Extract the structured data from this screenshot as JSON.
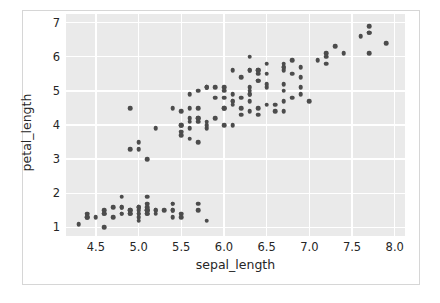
{
  "chart_data": {
    "type": "scatter",
    "title": "",
    "xlabel": "sepal_length",
    "ylabel": "petal_length",
    "xlim": [
      4.15,
      8.12
    ],
    "ylim": [
      0.75,
      7.25
    ],
    "xticks": [
      "4.5",
      "5.0",
      "5.5",
      "6.0",
      "6.5",
      "7.0",
      "7.5",
      "8.0"
    ],
    "xtick_values": [
      4.5,
      5.0,
      5.5,
      6.0,
      6.5,
      7.0,
      7.5,
      8.0
    ],
    "yticks": [
      "1",
      "2",
      "3",
      "4",
      "5",
      "6",
      "7"
    ],
    "ytick_values": [
      1,
      2,
      3,
      4,
      5,
      6,
      7
    ],
    "grid": true,
    "legend": "none",
    "style": "darkgrid",
    "marker_color": "#4c4c4c",
    "axes_bg_color": "#eaeaea",
    "grid_color": "#ffffff",
    "figure_bg_color": "#ffffff",
    "series": [
      {
        "name": "iris",
        "x": [
          5.1,
          4.9,
          4.7,
          4.6,
          5.0,
          5.4,
          4.6,
          5.0,
          4.4,
          4.9,
          5.4,
          4.8,
          4.8,
          4.3,
          5.8,
          5.7,
          5.4,
          5.1,
          5.7,
          5.1,
          5.4,
          5.1,
          4.6,
          5.1,
          4.8,
          5.0,
          5.0,
          5.2,
          5.2,
          4.7,
          4.8,
          5.4,
          5.2,
          5.5,
          4.9,
          5.0,
          5.5,
          4.9,
          4.4,
          5.1,
          5.0,
          4.5,
          4.4,
          5.0,
          5.1,
          4.8,
          5.1,
          4.6,
          5.3,
          5.0,
          7.0,
          6.4,
          6.9,
          5.5,
          6.5,
          5.7,
          6.3,
          4.9,
          6.6,
          5.2,
          5.0,
          5.9,
          6.0,
          6.1,
          5.6,
          6.7,
          5.6,
          5.8,
          6.2,
          5.6,
          5.9,
          6.1,
          6.3,
          6.1,
          6.4,
          6.6,
          6.8,
          6.7,
          6.0,
          5.7,
          5.5,
          5.5,
          5.8,
          6.0,
          5.4,
          6.0,
          6.7,
          6.3,
          5.6,
          5.5,
          5.5,
          6.1,
          5.8,
          5.0,
          5.6,
          5.7,
          5.7,
          6.2,
          5.1,
          5.7,
          6.3,
          5.8,
          7.1,
          6.3,
          6.5,
          7.6,
          4.9,
          7.3,
          6.7,
          7.2,
          6.5,
          6.4,
          6.8,
          5.7,
          5.8,
          6.4,
          6.5,
          7.7,
          7.7,
          6.0,
          6.9,
          5.6,
          7.7,
          6.3,
          6.7,
          7.2,
          6.2,
          6.1,
          6.4,
          7.2,
          7.4,
          7.9,
          6.4,
          6.3,
          6.1,
          7.7,
          6.3,
          6.4,
          6.0,
          6.9,
          6.7,
          6.9,
          5.8,
          6.8,
          6.7,
          6.7,
          6.3,
          6.5,
          6.2,
          5.9
        ],
        "y": [
          1.4,
          1.4,
          1.3,
          1.5,
          1.4,
          1.7,
          1.4,
          1.5,
          1.4,
          1.5,
          1.5,
          1.6,
          1.4,
          1.1,
          1.2,
          1.5,
          1.3,
          1.4,
          1.7,
          1.5,
          1.7,
          1.5,
          1.0,
          1.7,
          1.9,
          1.6,
          1.6,
          1.5,
          1.4,
          1.6,
          1.6,
          1.5,
          1.5,
          1.4,
          1.5,
          1.2,
          1.3,
          1.4,
          1.3,
          1.5,
          1.3,
          1.3,
          1.3,
          1.6,
          1.9,
          1.4,
          1.6,
          1.4,
          1.5,
          1.4,
          4.7,
          4.5,
          4.9,
          4.0,
          4.6,
          4.5,
          4.7,
          3.3,
          4.6,
          3.9,
          3.5,
          4.2,
          4.0,
          4.7,
          3.6,
          4.4,
          4.5,
          4.1,
          4.5,
          3.9,
          4.8,
          4.0,
          4.9,
          4.7,
          4.3,
          4.4,
          4.8,
          5.0,
          4.5,
          3.5,
          3.8,
          3.7,
          3.9,
          5.1,
          4.5,
          4.5,
          4.7,
          4.4,
          4.1,
          4.0,
          4.4,
          4.6,
          4.0,
          3.3,
          4.2,
          4.2,
          4.2,
          4.3,
          3.0,
          4.1,
          6.0,
          5.1,
          5.9,
          5.6,
          5.8,
          6.6,
          4.5,
          6.3,
          5.8,
          6.1,
          5.1,
          5.3,
          5.5,
          5.0,
          5.1,
          5.3,
          5.5,
          6.7,
          6.9,
          5.0,
          5.7,
          4.9,
          6.7,
          4.9,
          5.7,
          6.0,
          4.8,
          4.9,
          5.6,
          5.8,
          6.1,
          6.4,
          5.6,
          5.1,
          5.6,
          6.1,
          5.6,
          5.5,
          4.8,
          5.4,
          5.6,
          5.1,
          5.1,
          5.9,
          5.7,
          5.2,
          5.0,
          5.2,
          5.4,
          5.1
        ]
      }
    ]
  }
}
